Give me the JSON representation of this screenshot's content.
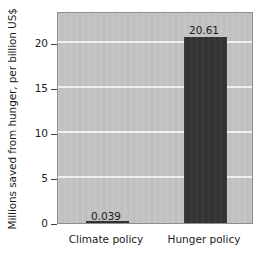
{
  "chart_data": {
    "type": "bar",
    "title": "",
    "xlabel": "",
    "ylabel": "Millions saved from hunger, per billion US$",
    "categories": [
      "Climate policy",
      "Hunger policy"
    ],
    "values": [
      0.039,
      20.61
    ],
    "value_labels": [
      "0.039",
      "20.61"
    ],
    "yticks": [
      0,
      5,
      10,
      15,
      20
    ],
    "ytick_labels": [
      "0",
      "5",
      "10",
      "15",
      "20"
    ],
    "ylim": [
      0,
      23.3
    ],
    "grid": "horizontal",
    "legend": "none",
    "colors": {
      "bar": "#333436",
      "plot_background": "#c3c3c3",
      "gridline": "#f2f2f2",
      "frame": "#8f8f8f",
      "text": "#1c1c1c",
      "page_background": "#ffffff"
    }
  }
}
